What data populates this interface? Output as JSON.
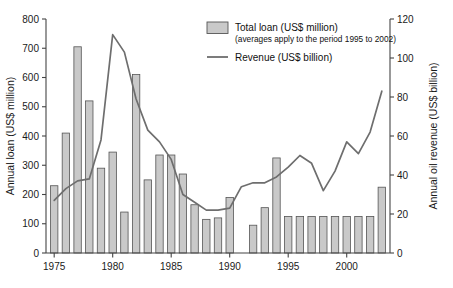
{
  "chart_data": {
    "type": "bar",
    "title": "",
    "xlabel": "",
    "ylabel": "Annual loan (US$ million)",
    "y2label": "Annual oil revenue (US$ billion)",
    "xlim": [
      1974.3,
      2003.7
    ],
    "ylim": [
      0,
      800
    ],
    "y2lim": [
      0,
      120
    ],
    "grid": false,
    "legend_position": "top-right",
    "x_ticks": [
      1975,
      1980,
      1985,
      1990,
      1995,
      2000
    ],
    "y_ticks": [
      0,
      100,
      200,
      300,
      400,
      500,
      600,
      700,
      800
    ],
    "y2_ticks": [
      0,
      20,
      40,
      60,
      80,
      100,
      120
    ],
    "categories": [
      1975,
      1976,
      1977,
      1978,
      1979,
      1980,
      1981,
      1982,
      1983,
      1984,
      1985,
      1986,
      1987,
      1988,
      1989,
      1990,
      1991,
      1992,
      1993,
      1994,
      1995,
      1996,
      1997,
      1998,
      1999,
      2000,
      2001,
      2002,
      2003
    ],
    "series": [
      {
        "name": "Total loan (US$ million)",
        "axis": "left",
        "type": "bar",
        "values": [
          230,
          410,
          705,
          520,
          290,
          345,
          140,
          610,
          250,
          335,
          335,
          270,
          165,
          115,
          120,
          190,
          null,
          95,
          155,
          325,
          125,
          125,
          125,
          125,
          125,
          125,
          125,
          125,
          225
        ]
      },
      {
        "name": "Revenue (US$ billion)",
        "axis": "right",
        "type": "line",
        "x": [
          1975,
          1976,
          1977,
          1978,
          1979,
          1980,
          1981,
          1982,
          1983,
          1984,
          1985,
          1986,
          1987,
          1988,
          1989,
          1990,
          1991,
          1992,
          1993,
          1994,
          1995,
          1996,
          1997,
          1998,
          1999,
          2000,
          2001,
          2002,
          2003
        ],
        "values": [
          27,
          33,
          37,
          38,
          58,
          112,
          103,
          79,
          63,
          57,
          48,
          30,
          26,
          22,
          22,
          23,
          34,
          36,
          36,
          39,
          44,
          50,
          46,
          32,
          42,
          57,
          51,
          62,
          83
        ]
      }
    ],
    "legend": [
      {
        "label": "Total loan (US$ million)",
        "sublabel": "(averages apply to the period 1995 to 2002)",
        "marker": "swatch",
        "color": "#c9c9c9"
      },
      {
        "label": "Revenue (US$ billion)",
        "sublabel": "",
        "marker": "line",
        "color": "#6e6e6e"
      }
    ]
  },
  "axes": {
    "left_title": "Annual loan (US$ million)",
    "right_title": "Annual oil revenue (US$ billion)",
    "left_ticks": [
      "0",
      "100",
      "200",
      "300",
      "400",
      "500",
      "600",
      "700",
      "800"
    ],
    "right_ticks": [
      "0",
      "20",
      "40",
      "60",
      "80",
      "100",
      "120"
    ],
    "x_ticks": [
      "1975",
      "1980",
      "1985",
      "1990",
      "1995",
      "2000"
    ]
  },
  "legend": {
    "loan_label": "Total loan (US$ million)",
    "loan_sublabel": "(averages apply to the period 1995 to 2002)",
    "revenue_label": "Revenue (US$ billion)"
  }
}
